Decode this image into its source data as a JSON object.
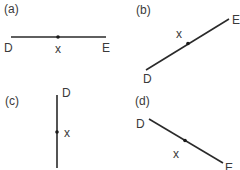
{
  "panels": [
    {
      "id": "a",
      "label": "(a)",
      "orientation": "horizontal",
      "endpoints": {
        "start": "D",
        "end": "E"
      },
      "point": "x",
      "geometry": {
        "x1": 11,
        "y1": 37,
        "x2": 106,
        "y2": 37,
        "px": 58,
        "py": 37
      }
    },
    {
      "id": "b",
      "label": "(b)",
      "orientation": "ascending-diagonal",
      "endpoints": {
        "start": "D",
        "end": "E"
      },
      "point": "x",
      "geometry": {
        "x1": 146,
        "y1": 70,
        "x2": 229,
        "y2": 19,
        "px": 188,
        "py": 43
      }
    },
    {
      "id": "c",
      "label": "(c)",
      "orientation": "vertical",
      "endpoints": {
        "start": "D",
        "end": "E"
      },
      "point": "x",
      "geometry": {
        "x1": 57,
        "y1": 95,
        "x2": 57,
        "y2": 168,
        "px": 57,
        "py": 132
      }
    },
    {
      "id": "d",
      "label": "(d)",
      "orientation": "descending-diagonal",
      "endpoints": {
        "start": "D",
        "end": "E"
      },
      "point": "x",
      "geometry": {
        "x1": 149,
        "y1": 119,
        "x2": 223,
        "y2": 163,
        "px": 185,
        "py": 141
      }
    }
  ],
  "colors": {
    "line": "#2a2a2a",
    "text": "#3a3a3a",
    "background": "#ffffff"
  }
}
